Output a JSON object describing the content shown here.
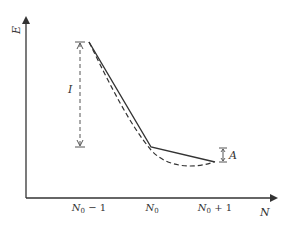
{
  "diagram": {
    "type": "energy-vs-particle-number",
    "axes": {
      "y_label": "E",
      "x_label": "N"
    },
    "x_ticks": [
      {
        "base": "N",
        "sub": "0",
        "suffix": " − 1",
        "x": 89
      },
      {
        "base": "N",
        "sub": "0",
        "suffix": "",
        "x": 152
      },
      {
        "base": "N",
        "sub": "0",
        "suffix": " + 1",
        "x": 215
      }
    ],
    "annotations": {
      "ionization": "I",
      "affinity": "A"
    },
    "series": [
      {
        "name": "piecewise-linear exact",
        "style": "solid",
        "points": [
          [
            89,
            42
          ],
          [
            151,
            147
          ],
          [
            215,
            162
          ]
        ]
      },
      {
        "name": "approximate convex curve",
        "style": "dashed"
      }
    ],
    "colors": {
      "line": "#333333",
      "label": "#333333",
      "background": "#ffffff"
    }
  }
}
